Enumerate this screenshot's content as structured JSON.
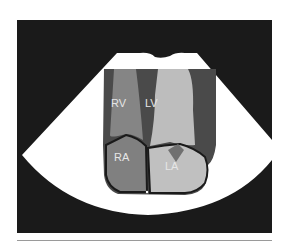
{
  "diagram": {
    "type": "echocardiogram-apical-four-chamber-view",
    "colors": {
      "background": "#1a1a1a",
      "sector": "#ffffff",
      "myocardium": "#4a4a4a",
      "rv": "#858585",
      "lv": "#bdbdbd",
      "ra": "#808080",
      "la": "#c0c0c0",
      "valve": "#707070",
      "outline": "#1a1a1a",
      "label": "#e6e6e6",
      "divider": "#9a9a9a"
    },
    "chambers": [
      {
        "id": "rv",
        "label": "RV"
      },
      {
        "id": "lv",
        "label": "LV"
      },
      {
        "id": "ra",
        "label": "RA"
      },
      {
        "id": "la",
        "label": "LA"
      }
    ]
  }
}
